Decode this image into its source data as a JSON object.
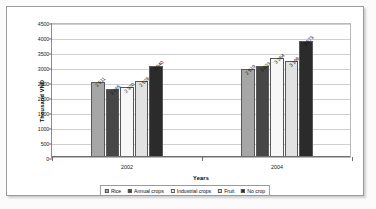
{
  "chart_data": {
    "type": "bar",
    "title": "",
    "subtitle": "",
    "xlabel": "Years",
    "ylabel": "Thousand VND",
    "categories": [
      "2002",
      "2004"
    ],
    "ylim": [
      0,
      4500
    ],
    "ytick_step": 500,
    "yticks": [
      "4500",
      "4000",
      "3500",
      "3000",
      "2500",
      "2000",
      "1500",
      "1000",
      "500",
      "0"
    ],
    "grid": true,
    "legend_position": "bottom",
    "series": [
      {
        "name": "Rice",
        "color": "#a6a6a6",
        "values": [
          2511,
          2919
        ],
        "labels": [
          "2 511",
          "2 919"
        ]
      },
      {
        "name": "Annual crops",
        "color": "#474747",
        "values": [
          2265,
          3033
        ],
        "labels": [
          "2 265",
          "3 033"
        ]
      },
      {
        "name": "Industrial crops",
        "color": "#f7f7f7",
        "values": [
          2320,
          3284
        ],
        "labels": [
          "2 320",
          "3 284"
        ]
      },
      {
        "name": "Fruit",
        "color": "#e2e2e2",
        "values": [
          2528,
          3198
        ],
        "labels": [
          "2 528",
          "3 198"
        ]
      },
      {
        "name": "No crop",
        "color": "#2b2b2b",
        "values": [
          3040,
          3873
        ],
        "labels": [
          "3 040",
          "3 873"
        ]
      }
    ]
  }
}
